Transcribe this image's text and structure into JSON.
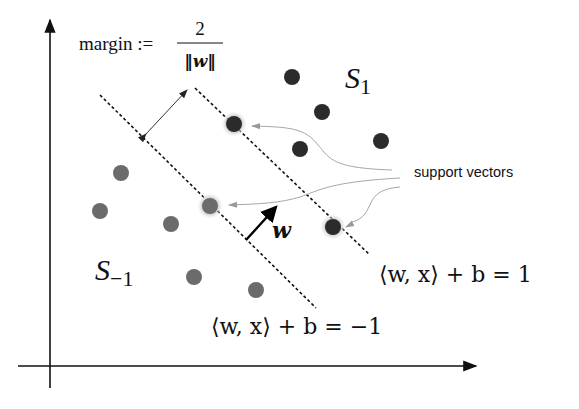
{
  "diagram": {
    "margin_label": {
      "prefix": "margin :=",
      "numerator": "2",
      "denominator": "‖w‖"
    },
    "class_positive_label": "S",
    "class_positive_sub": "1",
    "class_negative_label": "S",
    "class_negative_sub": "−1",
    "normal_vector_label": "w",
    "support_vectors_label": "support vectors",
    "upper_hyperplane_label": "⟨w, x⟩ + b = 1",
    "lower_hyperplane_label": "⟨w, x⟩ + b = −1",
    "colors": {
      "positive_points": "#2b2b2b",
      "negative_points": "#6b6b6b",
      "support_halo": "#c8c8c8",
      "annotation_arrows": "#9a9a9a",
      "axes": "#111111"
    },
    "points_positive": [
      {
        "x": 292,
        "y": 77,
        "support": false
      },
      {
        "x": 322,
        "y": 112,
        "support": false
      },
      {
        "x": 300,
        "y": 149,
        "support": false
      },
      {
        "x": 381,
        "y": 141,
        "support": false
      },
      {
        "x": 234,
        "y": 124,
        "support": true
      },
      {
        "x": 333,
        "y": 227,
        "support": true
      }
    ],
    "points_negative": [
      {
        "x": 121,
        "y": 173,
        "support": false
      },
      {
        "x": 100,
        "y": 211,
        "support": false
      },
      {
        "x": 171,
        "y": 224,
        "support": false
      },
      {
        "x": 194,
        "y": 277,
        "support": false
      },
      {
        "x": 256,
        "y": 290,
        "support": false
      },
      {
        "x": 210,
        "y": 206,
        "support": true
      }
    ]
  }
}
